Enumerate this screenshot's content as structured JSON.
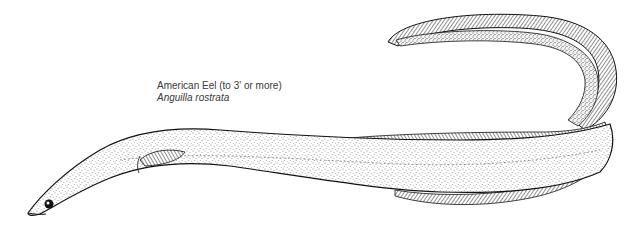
{
  "caption": {
    "common_name": "American Eel (to 3' or more)",
    "scientific_name": "Anguilla rostrata"
  },
  "illustration": {
    "subject": "American eel",
    "style": "black-and-white stipple and line drawing",
    "ink_color": "#111111",
    "paper_color": "#ffffff"
  }
}
